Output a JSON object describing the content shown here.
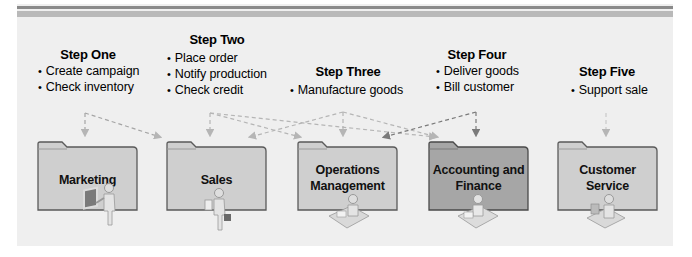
{
  "colors": {
    "panel_bg": "#efefef",
    "stripe_dark": "#8a8a8a",
    "stripe_light": "#b9b9b9",
    "folder_fill": "#cfcfcf",
    "folder_fill_highlight": "#a6a6a6",
    "folder_border": "#5a5a5a",
    "arrow_light": "#b5b5b5",
    "arrow_dark": "#7a7a7a"
  },
  "steps": [
    {
      "title": "Step One",
      "bullets": [
        "Create campaign",
        "Check inventory"
      ]
    },
    {
      "title": "Step Two",
      "bullets": [
        "Place order",
        "Notify production",
        "Check credit"
      ]
    },
    {
      "title": "Step Three",
      "bullets": [
        "Manufacture goods"
      ]
    },
    {
      "title": "Step Four",
      "bullets": [
        "Deliver goods",
        "Bill customer"
      ]
    },
    {
      "title": "Step Five",
      "bullets": [
        "Support sale"
      ]
    }
  ],
  "departments": [
    {
      "label_line1": "Marketing",
      "label_line2": "",
      "icon": "presenter-icon",
      "highlighted": false
    },
    {
      "label_line1": "Sales",
      "label_line2": "",
      "icon": "salesperson-icon",
      "highlighted": false
    },
    {
      "label_line1": "Operations",
      "label_line2": "Management",
      "icon": "desk-worker-icon",
      "highlighted": false
    },
    {
      "label_line1": "Accounting and",
      "label_line2": "Finance",
      "icon": "desk-worker-icon",
      "highlighted": true
    },
    {
      "label_line1": "Customer",
      "label_line2": "Service",
      "icon": "computer-user-icon",
      "highlighted": false
    }
  ],
  "flows": [
    {
      "from": "Step One",
      "to": [
        "Marketing",
        "Sales"
      ]
    },
    {
      "from": "Step Two",
      "to": [
        "Sales",
        "Operations Management",
        "Accounting and Finance"
      ]
    },
    {
      "from": "Step Three",
      "to": [
        "Sales",
        "Operations Management",
        "Accounting and Finance"
      ]
    },
    {
      "from": "Step Four",
      "to": [
        "Accounting and Finance",
        "Sales"
      ]
    },
    {
      "from": "Step Five",
      "to": [
        "Customer Service"
      ]
    }
  ]
}
